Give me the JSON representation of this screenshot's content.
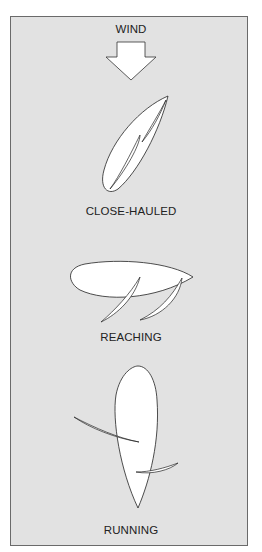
{
  "diagram": {
    "wind_label": "WIND",
    "wind_icon": "down-arrow-icon",
    "points_of_sail": [
      {
        "label": "CLOSE-HAULED"
      },
      {
        "label": "REACHING"
      },
      {
        "label": "RUNNING"
      }
    ],
    "colors": {
      "background": "#e2e2e2",
      "fill": "#ffffff",
      "stroke": "#222222",
      "frame_border": "#6a6a6a"
    }
  }
}
